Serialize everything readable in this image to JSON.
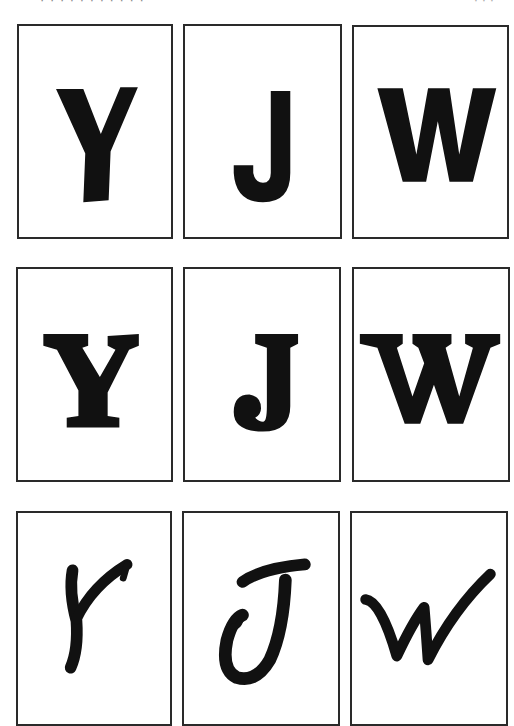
{
  "header": {
    "cropped_text_left": "· · · · · · · · · · ·",
    "cropped_text_right": "· · ·"
  },
  "rows": [
    {
      "style": "bold sans-serif",
      "cards": [
        {
          "letter": "Y"
        },
        {
          "letter": "J"
        },
        {
          "letter": "W"
        }
      ]
    },
    {
      "style": "bold serif",
      "cards": [
        {
          "letter": "Y"
        },
        {
          "letter": "J"
        },
        {
          "letter": "W"
        }
      ]
    },
    {
      "style": "handwritten brush script",
      "cards": [
        {
          "letter": "Y"
        },
        {
          "letter": "J"
        },
        {
          "letter": "W"
        }
      ]
    }
  ],
  "colors": {
    "ink": "#111111",
    "border": "#2a2a2a",
    "background": "#ffffff"
  }
}
